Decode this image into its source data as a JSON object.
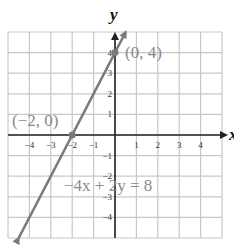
{
  "chart_data": {
    "type": "line",
    "title": "",
    "xlabel": "x",
    "ylabel": "y",
    "xlim": [
      -5,
      5
    ],
    "ylim": [
      -5,
      5
    ],
    "grid": true,
    "x_ticks": [
      "-4",
      "-3",
      "-2",
      "-1",
      "1",
      "2",
      "3",
      "4"
    ],
    "y_ticks": [
      "4",
      "3",
      "2",
      "1",
      "-1",
      "-2",
      "-3",
      "-4"
    ],
    "series": [
      {
        "name": "-4x + 2y = 8",
        "equation": "y = 2x + 4",
        "slope": 2,
        "intercept": 4,
        "x": [
          -4.5,
          0.5
        ],
        "y": [
          -5,
          5
        ]
      }
    ],
    "points": [
      {
        "label": "(0, 4)",
        "x": 0,
        "y": 4
      },
      {
        "label": "(-2, 0)",
        "x": -2,
        "y": 0
      }
    ],
    "annotations": [
      "-4x + 2y = 8"
    ]
  },
  "labels": {
    "x_axis": "x",
    "y_axis": "y",
    "point_a": "(0, 4)",
    "point_b": "(−2, 0)",
    "equation": "−4x + 2y = 8"
  },
  "ticks": {
    "x": [
      {
        "v": -4,
        "t": "−4"
      },
      {
        "v": -3,
        "t": "−3"
      },
      {
        "v": -2,
        "t": "−2"
      },
      {
        "v": -1,
        "t": "−1"
      },
      {
        "v": 1,
        "t": "1"
      },
      {
        "v": 2,
        "t": "2"
      },
      {
        "v": 3,
        "t": "3"
      },
      {
        "v": 4,
        "t": "4"
      }
    ],
    "y": [
      {
        "v": 4,
        "t": "4"
      },
      {
        "v": 3,
        "t": "3"
      },
      {
        "v": 2,
        "t": "2"
      },
      {
        "v": 1,
        "t": "1"
      },
      {
        "v": -1,
        "t": "−1"
      },
      {
        "v": -2,
        "t": "−2"
      },
      {
        "v": -3,
        "t": "−3"
      },
      {
        "v": -4,
        "t": "−4"
      }
    ]
  },
  "colors": {
    "grid": "#c8c8c8",
    "axis": "#222222",
    "line": "#7a7a7a",
    "label": "#8a8a8a"
  }
}
